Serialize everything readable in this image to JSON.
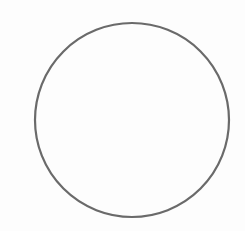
{
  "figure": {
    "shape": "circle",
    "center": {
      "x": 132,
      "y": 120
    },
    "radius": 97,
    "stroke_color": "#6a6a6a",
    "stroke_width": 2.2,
    "fill": "none",
    "background": "#fdfdfd"
  }
}
